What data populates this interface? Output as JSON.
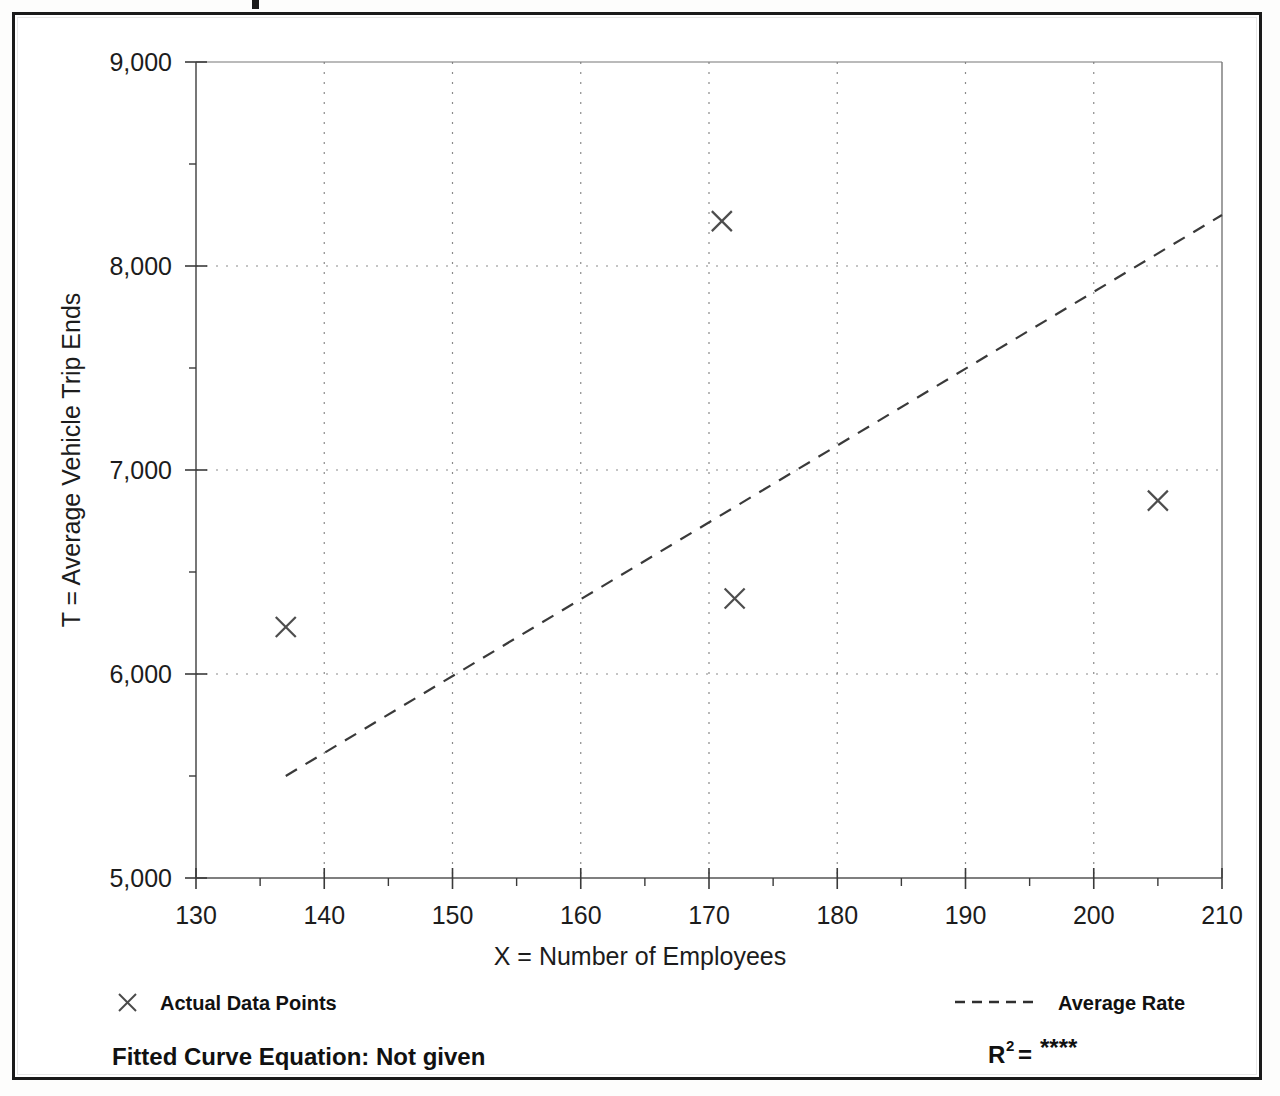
{
  "figure": {
    "background_color": "#ffffff",
    "border_color": "#1a1a1a"
  },
  "chart_data": {
    "type": "scatter",
    "title": "",
    "xlabel": "X = Number of Employees",
    "ylabel": "T = Average Vehicle Trip Ends",
    "xlim": [
      130,
      210
    ],
    "ylim": [
      5000,
      9000
    ],
    "xticks": [
      130,
      140,
      150,
      160,
      170,
      180,
      190,
      200,
      210
    ],
    "xtick_labels": [
      "130",
      "140",
      "150",
      "160",
      "170",
      "180",
      "190",
      "200",
      "210"
    ],
    "yticks": [
      5000,
      6000,
      7000,
      8000,
      9000
    ],
    "ytick_labels": [
      "5,000",
      "6,000",
      "7,000",
      "8,000",
      "9,000"
    ],
    "x_minor_step": 5,
    "y_minor_step": 500,
    "grid": "dotted-major-both",
    "legend_position": "below-axes",
    "series": [
      {
        "name": "Actual Data Points",
        "marker": "x",
        "type": "scatter",
        "points": [
          {
            "x": 137,
            "y": 6230
          },
          {
            "x": 171,
            "y": 8220
          },
          {
            "x": 172,
            "y": 6370
          },
          {
            "x": 205,
            "y": 6850
          }
        ]
      },
      {
        "name": "Average Rate",
        "marker": "dashed-line",
        "type": "line",
        "points": [
          {
            "x": 137,
            "y": 5500
          },
          {
            "x": 210,
            "y": 8250
          }
        ]
      }
    ],
    "annotations": {
      "fitted_curve_label": "Fitted Curve Equation:  Not given",
      "r_squared_label": "R",
      "r_squared_exponent": "2",
      "r_squared_equals": "=",
      "r_squared_value": "****"
    }
  },
  "legend": {
    "entries": [
      {
        "label": "Actual Data Points",
        "marker": "x-marker-icon"
      },
      {
        "label": "Average Rate",
        "marker": "dashed-line-icon"
      }
    ]
  },
  "footer": {
    "equation_text": "Fitted Curve Equation:  Not given",
    "r_text": "R",
    "r_exponent": "2",
    "r_equals": "=",
    "r_value": "****"
  }
}
